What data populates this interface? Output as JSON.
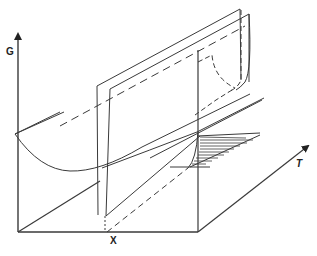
{
  "diagram": {
    "type": "3d free-energy surface sketch",
    "axes": {
      "vertical": "G",
      "horizontal": "X",
      "depth": "T"
    },
    "colors": {
      "line": "#3a3a3a",
      "background": "#ffffff"
    }
  }
}
